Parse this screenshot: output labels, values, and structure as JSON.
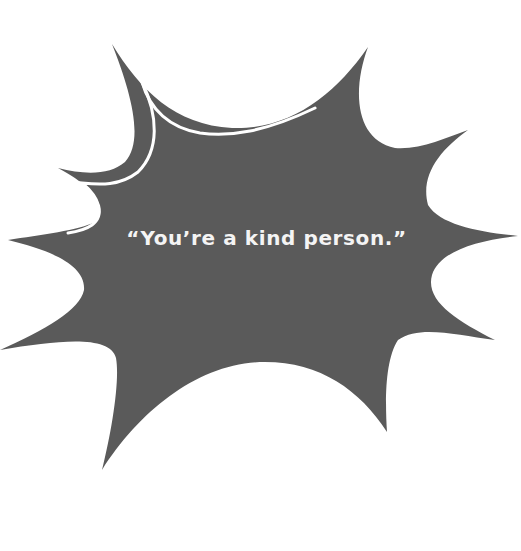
{
  "speech_bubble": {
    "shape": "starburst-explosion",
    "fill_color": "#5a5a5a",
    "highlight_color": "#ffffff",
    "quote": "“You’re a kind person.”"
  }
}
